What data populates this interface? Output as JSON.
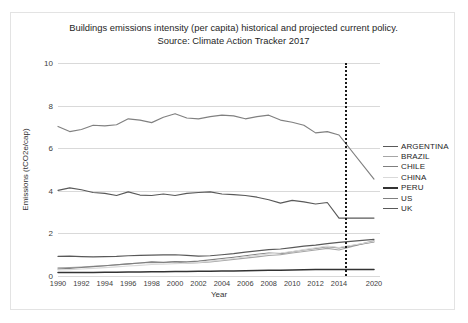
{
  "figure": {
    "title_line1": "Buildings emissions intensity (per capita) historical and projected current policy.",
    "title_line2": "Source: Climate Action Tracker 2017"
  },
  "chart_data": {
    "type": "line",
    "title": "Buildings emissions intensity (per capita) historical and projected current policy. Source: Climate Action Tracker 2017",
    "xlabel": "Year",
    "ylabel": "Emissions (tCO2e/cap)",
    "ylim": [
      0,
      10
    ],
    "yticks": [
      0,
      2,
      4,
      6,
      8,
      10
    ],
    "xlim": [
      1990,
      2021
    ],
    "xticks": [
      1990,
      1992,
      1994,
      1996,
      1998,
      2000,
      2002,
      2004,
      2006,
      2008,
      2010,
      2012,
      2014,
      2020
    ],
    "grid": true,
    "legend_position": "right",
    "annotation_divider_year": 2015,
    "x": [
      1990,
      1991,
      1992,
      1993,
      1994,
      1995,
      1996,
      1997,
      1998,
      1999,
      2000,
      2001,
      2002,
      2003,
      2004,
      2005,
      2006,
      2007,
      2008,
      2009,
      2010,
      2011,
      2012,
      2013,
      2014,
      2020
    ],
    "series": [
      {
        "name": "ARGENTINA",
        "color": "#595959",
        "values": [
          0.92,
          0.93,
          0.91,
          0.9,
          0.91,
          0.92,
          0.95,
          0.97,
          0.98,
          0.99,
          1.0,
          0.97,
          0.93,
          0.95,
          1.0,
          1.05,
          1.12,
          1.18,
          1.24,
          1.27,
          1.33,
          1.4,
          1.45,
          1.52,
          1.58,
          1.72
        ]
      },
      {
        "name": "BRAZIL",
        "color": "#a6a6a6",
        "values": [
          0.38,
          0.4,
          0.42,
          0.45,
          0.48,
          0.52,
          0.57,
          0.61,
          0.64,
          0.62,
          0.66,
          0.6,
          0.62,
          0.66,
          0.72,
          0.78,
          0.84,
          0.9,
          0.96,
          1.0,
          1.08,
          1.15,
          1.22,
          1.3,
          1.22,
          1.66
        ]
      },
      {
        "name": "CHILE",
        "color": "#7f7f7f",
        "values": [
          0.33,
          0.36,
          0.4,
          0.44,
          0.48,
          0.53,
          0.57,
          0.61,
          0.66,
          0.64,
          0.68,
          0.66,
          0.7,
          0.76,
          0.82,
          0.88,
          0.95,
          1.02,
          1.08,
          1.05,
          1.14,
          1.22,
          1.3,
          1.38,
          1.32,
          1.6
        ]
      },
      {
        "name": "CHINA",
        "color": "#d9d9d9",
        "values": [
          0.28,
          0.3,
          0.33,
          0.36,
          0.39,
          0.43,
          0.47,
          0.5,
          0.54,
          0.55,
          0.58,
          0.6,
          0.64,
          0.7,
          0.76,
          0.82,
          0.9,
          0.97,
          1.04,
          1.08,
          1.15,
          1.24,
          1.32,
          1.4,
          1.34,
          1.62
        ]
      },
      {
        "name": "PERU",
        "color": "#333333",
        "values": [
          0.16,
          0.16,
          0.17,
          0.17,
          0.18,
          0.18,
          0.19,
          0.19,
          0.2,
          0.2,
          0.21,
          0.21,
          0.22,
          0.22,
          0.23,
          0.24,
          0.25,
          0.26,
          0.27,
          0.27,
          0.28,
          0.29,
          0.3,
          0.31,
          0.31,
          0.31
        ]
      },
      {
        "name": "US",
        "color": "#808080",
        "values": [
          7.02,
          6.78,
          6.88,
          7.08,
          7.05,
          7.1,
          7.38,
          7.32,
          7.2,
          7.45,
          7.62,
          7.42,
          7.38,
          7.48,
          7.55,
          7.52,
          7.38,
          7.48,
          7.55,
          7.32,
          7.22,
          7.08,
          6.72,
          6.78,
          6.62,
          4.55
        ]
      },
      {
        "name": "UK",
        "color": "#595959",
        "values": [
          4.02,
          4.14,
          4.05,
          3.92,
          3.88,
          3.78,
          3.95,
          3.8,
          3.78,
          3.85,
          3.78,
          3.88,
          3.92,
          3.95,
          3.85,
          3.82,
          3.78,
          3.7,
          3.58,
          3.42,
          3.55,
          3.48,
          3.38,
          3.45,
          2.72,
          2.72
        ]
      }
    ]
  },
  "legend": {
    "items": [
      {
        "label": "ARGENTINA",
        "color": "#595959"
      },
      {
        "label": "BRAZIL",
        "color": "#a6a6a6"
      },
      {
        "label": "CHILE",
        "color": "#7f7f7f"
      },
      {
        "label": "CHINA",
        "color": "#d9d9d9"
      },
      {
        "label": "PERU",
        "color": "#333333"
      },
      {
        "label": "US",
        "color": "#808080"
      },
      {
        "label": "UK",
        "color": "#595959"
      }
    ]
  }
}
